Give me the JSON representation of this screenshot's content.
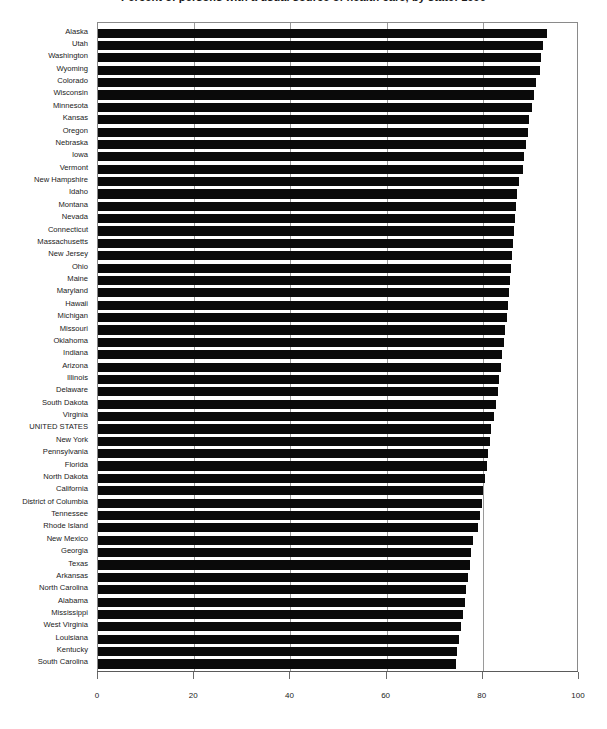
{
  "chart_data": {
    "type": "bar",
    "orientation": "horizontal",
    "title": "Percent of persons with a usual source of health care, by state: 1996",
    "xlabel": "",
    "ylabel": "",
    "xlim": [
      0,
      100
    ],
    "xticks": [
      0,
      20,
      40,
      60,
      80,
      100
    ],
    "xticklabels": [
      "0",
      "20",
      "40",
      "60",
      "80",
      "100"
    ],
    "grid": true,
    "grid_axis": "x",
    "legend": false,
    "bar_color": "#0a0a0a",
    "categories": [
      "Alaska",
      "Utah",
      "Washington",
      "Wyoming",
      "Colorado",
      "Wisconsin",
      "Minnesota",
      "Kansas",
      "Oregon",
      "Nebraska",
      "Iowa",
      "Vermont",
      "New Hampshire",
      "Idaho",
      "Montana",
      "Nevada",
      "Connecticut",
      "Massachusetts",
      "New Jersey",
      "Ohio",
      "Maine",
      "Maryland",
      "Hawaii",
      "Michigan",
      "Missouri",
      "Oklahoma",
      "Indiana",
      "Arizona",
      "Illinois",
      "Delaware",
      "South Dakota",
      "Virginia",
      "UNITED STATES",
      "New York",
      "Pennsylvania",
      "Florida",
      "North Dakota",
      "California",
      "District of Columbia",
      "Tennessee",
      "Rhode Island",
      "New Mexico",
      "Georgia",
      "Texas",
      "Arkansas",
      "North Carolina",
      "Alabama",
      "Mississippi",
      "West Virginia",
      "Louisiana",
      "Kentucky",
      "South Carolina"
    ],
    "values": [
      93.4,
      92.6,
      92.0,
      91.8,
      91.0,
      90.7,
      90.2,
      89.6,
      89.4,
      89.0,
      88.6,
      88.3,
      87.6,
      87.2,
      86.9,
      86.7,
      86.5,
      86.3,
      86.1,
      85.9,
      85.7,
      85.5,
      85.2,
      85.0,
      84.7,
      84.4,
      84.0,
      83.7,
      83.4,
      83.1,
      82.8,
      82.4,
      81.7,
      81.4,
      81.1,
      80.8,
      80.4,
      80.1,
      79.8,
      79.5,
      79.1,
      78.0,
      77.6,
      77.3,
      77.0,
      76.6,
      76.2,
      75.8,
      75.4,
      75.0,
      74.7,
      74.4
    ],
    "highlight_category": "UNITED STATES"
  },
  "axis": {
    "x_tick_labels": [
      "0",
      "20",
      "40",
      "60",
      "80",
      "100"
    ]
  }
}
